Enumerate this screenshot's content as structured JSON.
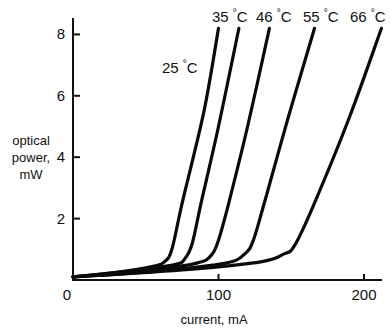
{
  "chart_data": {
    "type": "line",
    "title": "",
    "xlabel": "current, mA",
    "ylabel": "optical power, mW",
    "ylabel_lines": [
      "optical",
      "power,",
      "mW"
    ],
    "xlim": [
      0,
      215
    ],
    "ylim": [
      0,
      8.5
    ],
    "xticks": [
      0,
      100,
      200
    ],
    "xtick_labels": [
      "0",
      "100",
      "200"
    ],
    "yticks": [
      2,
      4,
      6,
      8
    ],
    "ytick_labels": [
      "2",
      "4",
      "6",
      "8"
    ],
    "grid": false,
    "legend": "inline labels at curve tops",
    "series": [
      {
        "name": "25 °C",
        "temp": "25",
        "points": [
          [
            0,
            0.1
          ],
          [
            30,
            0.25
          ],
          [
            55,
            0.45
          ],
          [
            63,
            0.6
          ],
          [
            68,
            1.0
          ],
          [
            75,
            2.5
          ],
          [
            90,
            5.5
          ],
          [
            100,
            8.2
          ]
        ]
      },
      {
        "name": "35 °C",
        "temp": "35",
        "points": [
          [
            0,
            0.1
          ],
          [
            40,
            0.3
          ],
          [
            70,
            0.5
          ],
          [
            77,
            0.7
          ],
          [
            82,
            1.2
          ],
          [
            88,
            2.5
          ],
          [
            100,
            5.0
          ],
          [
            114,
            8.2
          ]
        ]
      },
      {
        "name": "46 °C",
        "temp": "46",
        "points": [
          [
            0,
            0.1
          ],
          [
            50,
            0.3
          ],
          [
            85,
            0.55
          ],
          [
            95,
            0.8
          ],
          [
            100,
            1.3
          ],
          [
            107,
            2.5
          ],
          [
            120,
            5.0
          ],
          [
            135,
            8.2
          ]
        ]
      },
      {
        "name": "55 °C",
        "temp": "55",
        "points": [
          [
            0,
            0.1
          ],
          [
            60,
            0.3
          ],
          [
            105,
            0.55
          ],
          [
            118,
            0.85
          ],
          [
            124,
            1.3
          ],
          [
            132,
            2.6
          ],
          [
            148,
            5.3
          ],
          [
            166,
            8.2
          ]
        ]
      },
      {
        "name": "66 °C",
        "temp": "66",
        "points": [
          [
            0,
            0.1
          ],
          [
            80,
            0.35
          ],
          [
            130,
            0.6
          ],
          [
            145,
            0.85
          ],
          [
            152,
            1.1
          ],
          [
            165,
            2.4
          ],
          [
            190,
            5.3
          ],
          [
            212,
            8.2
          ]
        ]
      }
    ]
  },
  "labels": {
    "x_axis": "current, mA",
    "y_axis": [
      "optical",
      "power,",
      "mW"
    ],
    "origin": "0",
    "deg_symbol": "°",
    "unit": "C",
    "series": [
      "25",
      "35",
      "46",
      "55",
      "66"
    ]
  }
}
